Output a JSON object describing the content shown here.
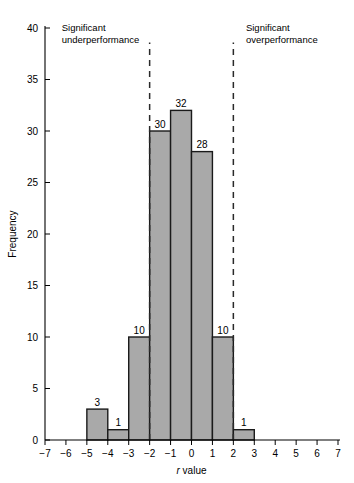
{
  "chart_data": {
    "type": "bar",
    "title": "",
    "subtitle": "",
    "xlabel": "r value",
    "xlabel_italic_prefix": "r",
    "xlabel_rest": " value",
    "ylabel": "Frequency",
    "xlim": [
      -7,
      7
    ],
    "ylim": [
      0,
      40
    ],
    "grid": false,
    "legend": null,
    "bin_width": 1,
    "x_ticks": [
      -7,
      -6,
      -5,
      -4,
      -3,
      -2,
      -1,
      0,
      1,
      2,
      3,
      4,
      5,
      6,
      7
    ],
    "x_tick_labels": [
      "−7",
      "−6",
      "−5",
      "−4",
      "−3",
      "−2",
      "−1",
      "0",
      "1",
      "2",
      "3",
      "4",
      "5",
      "6",
      "7"
    ],
    "y_ticks": [
      0,
      5,
      10,
      15,
      20,
      25,
      30,
      35,
      40
    ],
    "y_tick_labels": [
      "0",
      "5",
      "10",
      "15",
      "20",
      "25",
      "30",
      "35",
      "40"
    ],
    "bins": [
      {
        "x_start": -5,
        "x_end": -4,
        "value": 3,
        "label": "3"
      },
      {
        "x_start": -4,
        "x_end": -3,
        "value": 1,
        "label": "1"
      },
      {
        "x_start": -3,
        "x_end": -2,
        "value": 10,
        "label": "10"
      },
      {
        "x_start": -2,
        "x_end": -1,
        "value": 30,
        "label": "30"
      },
      {
        "x_start": -1,
        "x_end": 0,
        "value": 32,
        "label": "32"
      },
      {
        "x_start": 0,
        "x_end": 1,
        "value": 28,
        "label": "28"
      },
      {
        "x_start": 1,
        "x_end": 2,
        "value": 10,
        "label": "10"
      },
      {
        "x_start": 2,
        "x_end": 3,
        "value": 1,
        "label": "1"
      }
    ],
    "reference_lines": [
      {
        "x": -2,
        "style": "dashed",
        "name": "significance-threshold-left"
      },
      {
        "x": 2,
        "style": "dashed",
        "name": "significance-threshold-right"
      }
    ],
    "annotations": [
      {
        "line1": "Significant",
        "line2": "underperformance",
        "x_data": -6.2,
        "y_data": 40.0
      },
      {
        "line1": "Significant",
        "line2": "overperformance",
        "x_data": 2.6,
        "y_data": 40.0
      }
    ],
    "colors": {
      "bar_fill": "#a9a9a9",
      "bar_stroke": "#1a1a1a",
      "axis": "#000000",
      "reference_line": "#2a2a2a",
      "background": "#ffffff"
    }
  }
}
